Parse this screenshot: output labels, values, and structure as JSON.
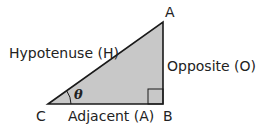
{
  "diagram": {
    "type": "right-triangle",
    "vertices": {
      "A": {
        "label": "A",
        "x": 163,
        "y": 22
      },
      "B": {
        "label": "B",
        "x": 163,
        "y": 104
      },
      "C": {
        "label": "C",
        "x": 48,
        "y": 104
      }
    },
    "sides": {
      "hypotenuse": "Hypotenuse (H)",
      "opposite": "Opposite (O)",
      "adjacent": "Adjacent (A)"
    },
    "angle_label": "θ",
    "colors": {
      "fill": "#c8c8c8",
      "stroke": "#1a1a1a",
      "text": "#222222",
      "background": "#ffffff"
    }
  }
}
